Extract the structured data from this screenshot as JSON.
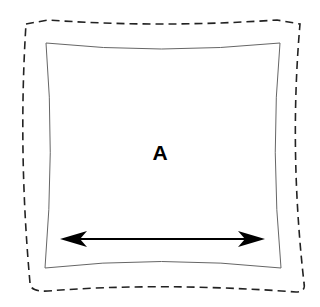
{
  "diagram": {
    "label": "A",
    "outer_boundary": {
      "style": "dashed",
      "color": "#222222"
    },
    "inner_shape": {
      "style": "solid-thin",
      "color": "#555555",
      "sides": "concave"
    },
    "arrow": {
      "type": "double-headed",
      "direction": "horizontal",
      "color": "#000000"
    }
  }
}
